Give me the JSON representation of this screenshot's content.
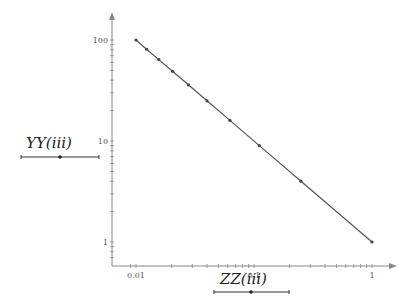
{
  "chart_data": {
    "type": "line",
    "title": "",
    "xlabel": "ZZ(iii)",
    "ylabel": "YY(iii)",
    "xscale": "log",
    "yscale": "log",
    "xlim": [
      0.008,
      1.6
    ],
    "ylim": [
      0.7,
      130
    ],
    "grid": false,
    "legend": null,
    "x_ticks": [
      0.01,
      0.1,
      1
    ],
    "x_tick_labels": [
      "0.01",
      "0.1",
      "1"
    ],
    "y_ticks": [
      1,
      10,
      100
    ],
    "y_tick_labels": [
      "1",
      "10",
      "100"
    ],
    "series": [
      {
        "name": "YY vs ZZ",
        "color": "#555555",
        "marker": "dot",
        "x": [
          0.01,
          0.0123,
          0.0156,
          0.0204,
          0.0278,
          0.04,
          0.0625,
          0.111,
          0.25,
          1
        ],
        "y": [
          100,
          81,
          64,
          49,
          36,
          25,
          16,
          9,
          4,
          1
        ]
      }
    ]
  },
  "labels": {
    "x_axis": {
      "base": "ZZ",
      "paren": "(iii)"
    },
    "y_axis": {
      "base": "YY",
      "paren": "(iii)"
    }
  },
  "sliders": {
    "y_slider": {
      "x1": 21,
      "x2": 99,
      "y": 157,
      "handle": 60
    },
    "x_slider": {
      "x1": 214,
      "x2": 289,
      "y": 292,
      "handle": 251
    }
  },
  "colors": {
    "axis": "#888888",
    "line": "#555555",
    "marker": "#444444",
    "text": "#222222"
  }
}
